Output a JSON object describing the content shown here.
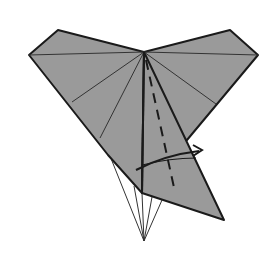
{
  "diagram": {
    "type": "origami-fold-step",
    "colors": {
      "paper": "#9a9a9a",
      "outline": "#1a1a1a",
      "crease": "#3a3a3a",
      "background": "#ffffff"
    },
    "symbols": [
      {
        "name": "valley-fold-line",
        "style": "dashed"
      },
      {
        "name": "fold-over-arrow",
        "direction": "right"
      }
    ]
  }
}
